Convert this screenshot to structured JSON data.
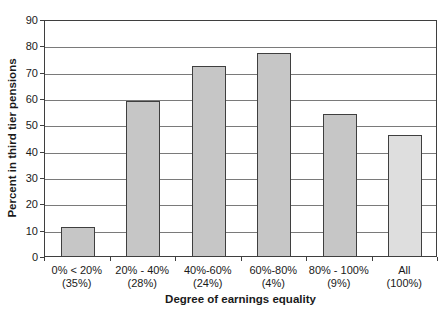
{
  "chart_data": {
    "type": "bar",
    "title": "",
    "xlabel": "Degree of earnings equality",
    "ylabel": "Percent in third tier pensions",
    "categories": [
      "0% < 20%",
      "20% - 40%",
      "40%-60%",
      "60%-80%",
      "80% - 100%",
      "All"
    ],
    "category_sublabels": [
      "(35%)",
      "(28%)",
      "(24%)",
      "(4%)",
      "(9%)",
      "(100%)"
    ],
    "values": [
      11,
      59,
      72,
      77,
      54,
      46
    ],
    "ylim": [
      0,
      90
    ],
    "yticks": [
      0,
      10,
      20,
      30,
      40,
      50,
      60,
      70,
      80,
      90
    ],
    "grid": true,
    "legend": false,
    "bar_fill_colors": [
      "#c6c6c6",
      "#c6c6c6",
      "#c6c6c6",
      "#c6c6c6",
      "#c6c6c6",
      "#dedede"
    ],
    "bar_border_color": "#3f3f3f",
    "gridline_color": "#7a7a7a",
    "axis_color": "#3f3f3f",
    "text_color": "#1a1a1a",
    "background_color": "#ffffff"
  }
}
